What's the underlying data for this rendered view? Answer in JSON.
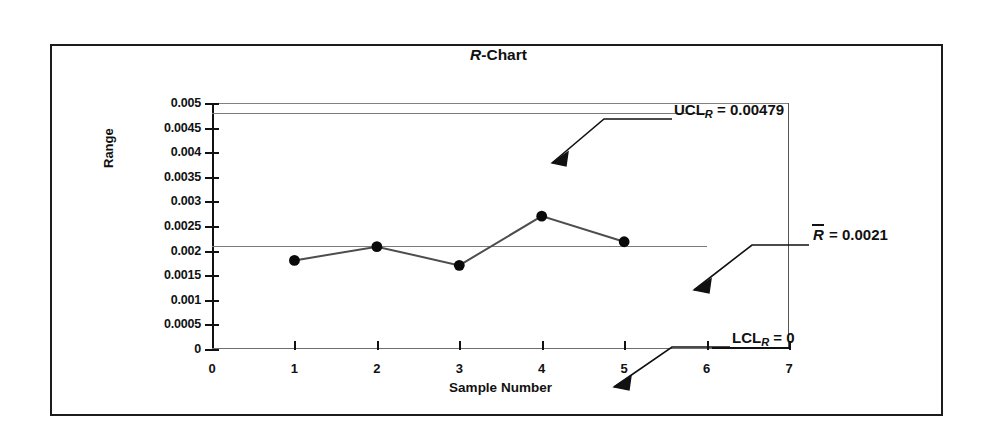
{
  "chart_data": {
    "type": "line",
    "title": "R-Chart",
    "title_italic_part": "R",
    "xlabel": "Sample Number",
    "ylabel": "Range",
    "x": [
      1,
      2,
      3,
      4,
      5
    ],
    "values": [
      0.0018,
      0.00208,
      0.0017,
      0.0027,
      0.00218
    ],
    "series": [
      {
        "name": "Range",
        "values": [
          0.0018,
          0.00208,
          0.0017,
          0.0027,
          0.00218
        ]
      }
    ],
    "xlim": [
      0,
      7
    ],
    "ylim": [
      0,
      0.005
    ],
    "grid": false,
    "legend": "none",
    "xticks": [
      "0",
      "1",
      "2",
      "3",
      "4",
      "5",
      "6",
      "7"
    ],
    "yticks": [
      "0",
      "0.0005",
      "0.001",
      "0.0015",
      "0.002",
      "0.0025",
      "0.003",
      "0.0035",
      "0.004",
      "0.0045",
      "0.005"
    ],
    "control_lines": [
      {
        "name": "UCL",
        "value": 0.00479
      },
      {
        "name": "CL",
        "value": 0.0021
      },
      {
        "name": "LCL",
        "value": 0
      }
    ],
    "annotations": [
      {
        "name": "ucl-label",
        "prefix": "UCL",
        "subscript": "R",
        "text": " = 0.00479",
        "overbar": false
      },
      {
        "name": "rbar-label",
        "prefix": "R",
        "subscript": "",
        "text": " = 0.0021",
        "overbar": true
      },
      {
        "name": "lcl-label",
        "prefix": "LCL",
        "subscript": "R",
        "text": " = 0",
        "overbar": false
      }
    ],
    "colors": {
      "line": "#4d4d4d",
      "marker": "#0a0a0a",
      "limit_line": "#7b7b7b",
      "axis": "#111111",
      "frame": "#1c1c1c"
    }
  },
  "annot": {
    "ucl_prefix": "UCL",
    "ucl_sub": "R",
    "ucl_value": " = 0.00479",
    "rbar_prefix": "R",
    "rbar_value": " = 0.0021",
    "lcl_prefix": "LCL",
    "lcl_sub": "R",
    "lcl_value": " = 0"
  }
}
